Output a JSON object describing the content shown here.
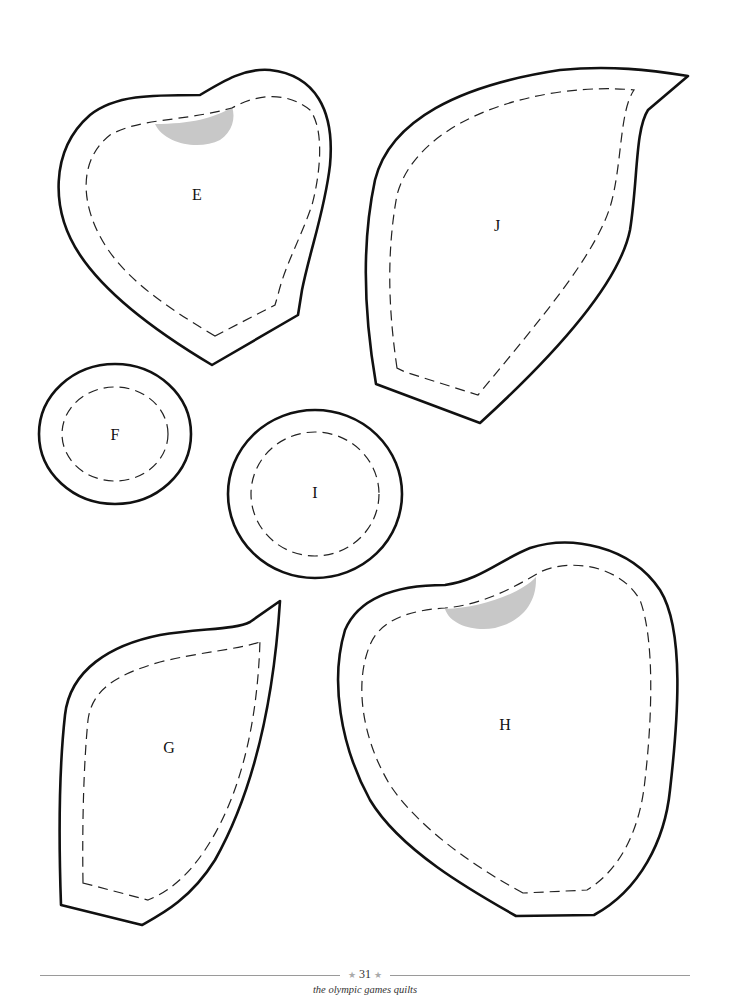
{
  "page": {
    "type": "quilt applique template sheet",
    "background": "#ffffff",
    "line_color": "#111111",
    "shade_color": "#c8c8c8"
  },
  "templates": [
    {
      "id": "E",
      "label": "E",
      "shape": "heart",
      "has_shaded_overlap": true
    },
    {
      "id": "J",
      "label": "J",
      "shape": "leaf-with-tip",
      "has_shaded_overlap": false
    },
    {
      "id": "F",
      "label": "F",
      "shape": "circle-small",
      "has_shaded_overlap": false
    },
    {
      "id": "I",
      "label": "I",
      "shape": "circle-medium",
      "has_shaded_overlap": false
    },
    {
      "id": "G",
      "label": "G",
      "shape": "leaf",
      "has_shaded_overlap": false
    },
    {
      "id": "H",
      "label": "H",
      "shape": "heart-large",
      "has_shaded_overlap": true
    }
  ],
  "footer": {
    "star_left": "★",
    "page_number": "31",
    "star_right": "★",
    "book_title": "the olympic games quilts"
  }
}
